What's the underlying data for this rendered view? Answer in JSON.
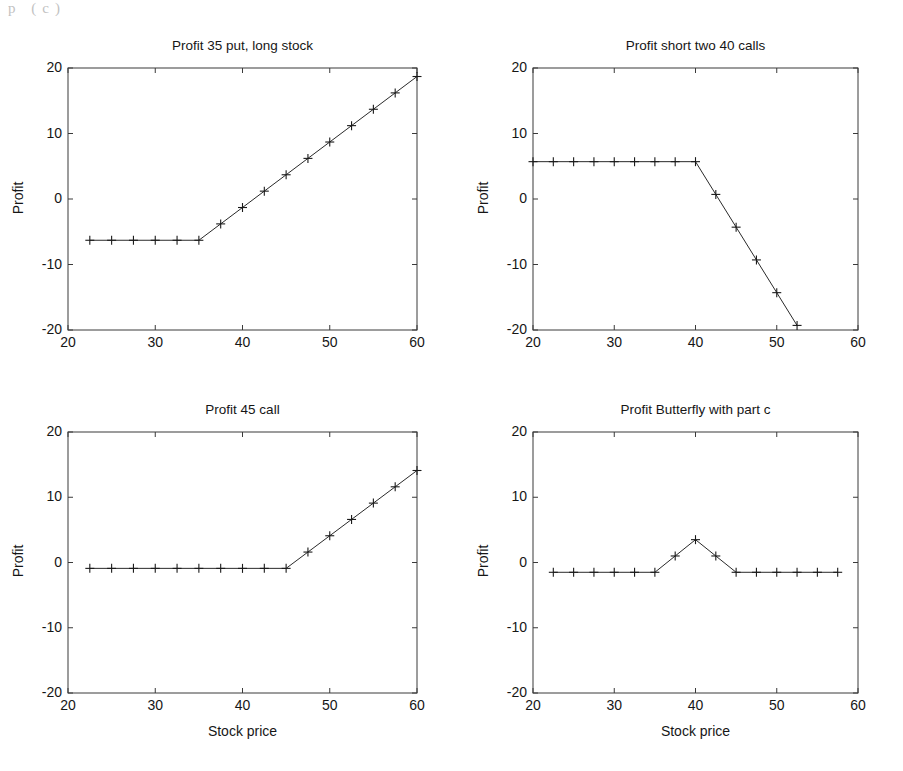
{
  "figure": {
    "width": 903,
    "height": 771,
    "background": "#ffffff",
    "line_color": "#2a2a2a",
    "axis_color": "#3a3a3a",
    "scan_artifact_text": "p  (c)"
  },
  "shared": {
    "xlabel": "Stock price",
    "ylabel": "Profit",
    "x_ticks": [
      20,
      30,
      40,
      50,
      60
    ],
    "y_ticks": [
      20,
      10,
      0,
      -10,
      -20
    ],
    "xlim": [
      20,
      60
    ],
    "ylim": [
      -20,
      20
    ],
    "marker": "plus",
    "grid": false,
    "legend": "none"
  },
  "chart_data": [
    {
      "id": "panel-1",
      "type": "line",
      "title": "Profit 35 put, long stock",
      "xlabel": "",
      "ylabel": "Profit",
      "xlim": [
        20,
        60
      ],
      "ylim": [
        -20,
        20
      ],
      "xticks": [
        20,
        30,
        40,
        50,
        60
      ],
      "yticks": [
        -20,
        -10,
        0,
        10,
        20
      ],
      "grid": false,
      "legend": "none",
      "marker": "plus",
      "x": [
        22.5,
        25,
        27.5,
        30,
        32.5,
        35,
        37.5,
        40,
        42.5,
        45,
        47.5,
        50,
        52.5,
        55,
        57.5,
        60
      ],
      "y": [
        -6.3,
        -6.3,
        -6.3,
        -6.3,
        -6.3,
        -6.3,
        -3.8,
        -1.3,
        1.2,
        3.7,
        6.2,
        8.7,
        11.2,
        13.7,
        16.2,
        18.7
      ]
    },
    {
      "id": "panel-2",
      "type": "line",
      "title": "Profit short two 40 calls",
      "xlabel": "",
      "ylabel": "Profit",
      "xlim": [
        20,
        60
      ],
      "ylim": [
        -20,
        20
      ],
      "xticks": [
        20,
        30,
        40,
        50,
        60
      ],
      "yticks": [
        -20,
        -10,
        0,
        10,
        20
      ],
      "grid": false,
      "legend": "none",
      "marker": "plus",
      "x": [
        20,
        22.5,
        25,
        27.5,
        30,
        32.5,
        35,
        37.5,
        40,
        42.5,
        45,
        47.5,
        50,
        52.5
      ],
      "y": [
        5.7,
        5.7,
        5.7,
        5.7,
        5.7,
        5.7,
        5.7,
        5.7,
        5.7,
        0.7,
        -4.3,
        -9.3,
        -14.3,
        -19.3
      ]
    },
    {
      "id": "panel-3",
      "type": "line",
      "title": "Profit 45 call",
      "xlabel": "Stock price",
      "ylabel": "Profit",
      "xlim": [
        20,
        60
      ],
      "ylim": [
        -20,
        20
      ],
      "xticks": [
        20,
        30,
        40,
        50,
        60
      ],
      "yticks": [
        -20,
        -10,
        0,
        10,
        20
      ],
      "grid": false,
      "legend": "none",
      "marker": "plus",
      "x": [
        22.5,
        25,
        27.5,
        30,
        32.5,
        35,
        37.5,
        40,
        42.5,
        45,
        47.5,
        50,
        52.5,
        55,
        57.5,
        60
      ],
      "y": [
        -0.9,
        -0.9,
        -0.9,
        -0.9,
        -0.9,
        -0.9,
        -0.9,
        -0.9,
        -0.9,
        -0.9,
        1.6,
        4.1,
        6.6,
        9.1,
        11.6,
        14.1
      ]
    },
    {
      "id": "panel-4",
      "type": "line",
      "title": "Profit Butterfly with part c",
      "xlabel": "Stock price",
      "ylabel": "Profit",
      "xlim": [
        20,
        60
      ],
      "ylim": [
        -20,
        20
      ],
      "xticks": [
        20,
        30,
        40,
        50,
        60
      ],
      "yticks": [
        -20,
        -10,
        0,
        10,
        20
      ],
      "grid": false,
      "legend": "none",
      "marker": "plus",
      "x": [
        22.5,
        25,
        27.5,
        30,
        32.5,
        35,
        37.5,
        40,
        42.5,
        45,
        47.5,
        50,
        52.5,
        55,
        57.5
      ],
      "y": [
        -1.5,
        -1.5,
        -1.5,
        -1.5,
        -1.5,
        -1.5,
        1.0,
        3.5,
        1.0,
        -1.5,
        -1.5,
        -1.5,
        -1.5,
        -1.5,
        -1.5
      ]
    }
  ],
  "panels": [
    {
      "name": "panel-1",
      "title": "Profit 35 put, long stock",
      "ylabel": "Profit",
      "xlabel": "",
      "box": {
        "left": 68,
        "top": 68,
        "width": 349,
        "height": 262
      },
      "title_top": 38,
      "ylabel_center_y": 199,
      "ylabel_x": 18,
      "show_xlabel": false
    },
    {
      "name": "panel-2",
      "title": "Profit short two 40 calls",
      "ylabel": "Profit",
      "xlabel": "",
      "box": {
        "left": 533,
        "top": 68,
        "width": 325,
        "height": 262
      },
      "title_top": 38,
      "ylabel_center_y": 199,
      "ylabel_x": 483,
      "show_xlabel": false
    },
    {
      "name": "panel-3",
      "title": "Profit 45 call",
      "ylabel": "Profit",
      "xlabel": "Stock price",
      "box": {
        "left": 68,
        "top": 432,
        "width": 349,
        "height": 261
      },
      "title_top": 402,
      "ylabel_center_y": 562,
      "ylabel_x": 18,
      "show_xlabel": true,
      "xlabel_top": 723
    },
    {
      "name": "panel-4",
      "title": "Profit Butterfly with part c",
      "ylabel": "Profit",
      "xlabel": "Stock price",
      "box": {
        "left": 533,
        "top": 432,
        "width": 325,
        "height": 261
      },
      "title_top": 402,
      "ylabel_center_y": 562,
      "ylabel_x": 483,
      "show_xlabel": true,
      "xlabel_top": 723
    }
  ]
}
